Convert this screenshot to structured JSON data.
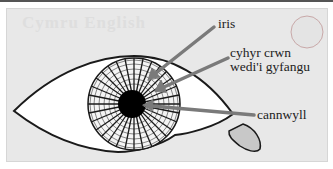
{
  "diagram": {
    "watermark": "Cymru English",
    "labels": [
      {
        "id": "iris",
        "text": "iris"
      },
      {
        "id": "ciliary",
        "line1": "cyhyr crwn",
        "line2": "wedi'i gyfangu"
      },
      {
        "id": "pupil",
        "text": "cannwyll"
      }
    ],
    "colors": {
      "panel": "#e8e8e8",
      "outline": "#1a1a1a",
      "arrow": "#7a7a7a",
      "pupil": "#000000",
      "caruncle": "#c8c8c8"
    }
  }
}
